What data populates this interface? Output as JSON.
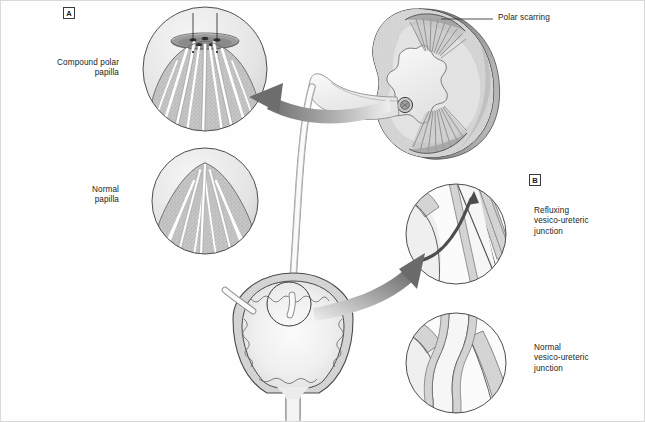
{
  "figure": {
    "panels": [
      {
        "tag": "A",
        "name": "renal-papilla-panel"
      },
      {
        "tag": "B",
        "name": "vesico-ureteric-junction-panel"
      }
    ]
  },
  "labels": {
    "compound_polar_papilla": "Compound polar\npapilla",
    "normal_papilla": "Normal\npapilla",
    "polar_scarring": "Polar scarring",
    "refluxing_vuj": "Refluxing\nvesico-ureteric\njunction",
    "normal_vuj": "Normal\nvesico-ureteric\njunction"
  },
  "structures": {
    "kidney": "kidney-coronal-section",
    "ureter": "ureter",
    "bladder": "urinary-bladder",
    "urethra": "urethra",
    "compound_papilla_inset": "compound-polar-papilla-inset",
    "normal_papilla_inset": "normal-papilla-inset",
    "refluxing_vuj_inset": "refluxing-vuj-inset",
    "normal_vuj_inset": "normal-vuj-inset",
    "reflux_arrow": "retrograde-urine-flow-arrow",
    "pointer_arrow_papilla": "magnify-arrow-to-papilla",
    "pointer_arrow_vuj": "magnify-arrow-to-vuj"
  },
  "colors": {
    "line": "#3a3a3a",
    "line_soft": "#6f6f6f",
    "parenchyma": "#b9b9b9",
    "parenchyma_light": "#d6d6d6",
    "lumen": "#f2f2f2",
    "cortex_fill": "#e8e8e8",
    "dark_posterior": "#7d7d7d",
    "arrow_dark": "#6b6b6b",
    "arrow_light": "#e6e6e6",
    "text": "#231f20",
    "frame": "#d9d9d9",
    "background": "#fefefe"
  }
}
